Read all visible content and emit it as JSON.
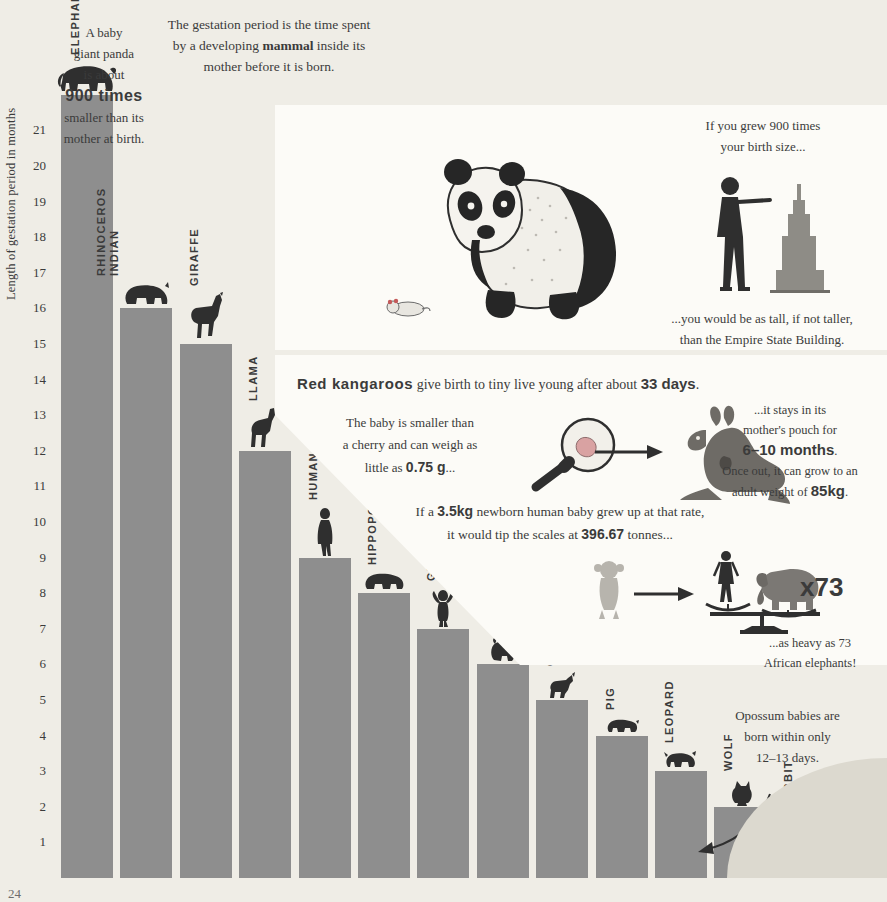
{
  "headline": {
    "line1": "The gestation period is the time spent",
    "line2_a": "by a developing ",
    "line2_b": "mammal",
    "line2_c": " inside its",
    "line3": "mother before it is born."
  },
  "chart_data": {
    "type": "bar",
    "title": "Length of gestation period in months",
    "ylabel": "Length of gestation period in months",
    "xlabel": "",
    "ylim": [
      0,
      22
    ],
    "yticks": [
      1,
      2,
      3,
      4,
      5,
      6,
      7,
      8,
      9,
      10,
      11,
      12,
      13,
      14,
      15,
      16,
      17,
      18,
      19,
      20,
      21
    ],
    "grid": false,
    "categories": [
      "ELEPHANT",
      "INDIAN RHINOCEROS",
      "GIRAFFE",
      "LLAMA",
      "HUMAN",
      "HIPPOPOTAMUS",
      "GIBBON",
      "BABOON",
      "GOAT",
      "PIG",
      "LEOPARD",
      "WOLF",
      "RABBIT",
      "OPOSSUM"
    ],
    "values": [
      22,
      16,
      15,
      12,
      9,
      8,
      7,
      6,
      5,
      4,
      3,
      2,
      1,
      0.4
    ],
    "bar_color": "#8e8e8e",
    "background": "#efede6"
  },
  "panda_panel": {
    "text": {
      "l1": "A baby",
      "l2": "giant panda",
      "l3": "is about",
      "big": "900 times",
      "l4": "smaller than its",
      "l5": "mother at birth."
    },
    "grew": {
      "l1": "If you grew 900 times",
      "l2": "your birth size..."
    },
    "empire": {
      "l1": "...you would be as tall, if not taller,",
      "l2": "than the Empire State Building."
    },
    "icons": [
      "panda-illustration",
      "baby-panda-illustration",
      "person-pointing-illustration",
      "empire-state-building-illustration"
    ]
  },
  "kangaroo_panel": {
    "headline_a": "Red kangaroos",
    "headline_b": " give birth to tiny live young after about ",
    "headline_days": "33 days",
    "headline_end": ".",
    "baby": {
      "l1": "The baby is smaller than",
      "l2": "a cherry and can weigh as",
      "l3_a": "little as ",
      "l3_b": "0.75 g",
      "l3_c": "..."
    },
    "pouch": {
      "l1": "...it stays in its",
      "l2": "mother's pouch for",
      "l2b": "6–10 months",
      "l3": ".",
      "l4": "Once out, it can grow to an",
      "l5_a": "adult weight of ",
      "l5_b": "85kg",
      "l5_c": "."
    },
    "rate": {
      "l1_a": "If a ",
      "l1_b": "3.5kg",
      "l1_c": " newborn human baby grew up at that rate,",
      "l2_a": "it would tip the scales at ",
      "l2_b": "396.67",
      "l2_c": " tonnes..."
    },
    "multiplier": "x73",
    "heavy": {
      "l1": "...as heavy as 73",
      "l2": "African elephants!"
    },
    "icons": [
      "magnifier-icon",
      "arrow-right-icon",
      "kangaroo-illustration",
      "monkey-illustration",
      "scales-illustration",
      "elephant-illustration",
      "human-illustration"
    ]
  },
  "opossum_note": {
    "l1": "Opossum babies are",
    "l2": "born within only",
    "l3": "12–13 days."
  },
  "page_number": "24"
}
